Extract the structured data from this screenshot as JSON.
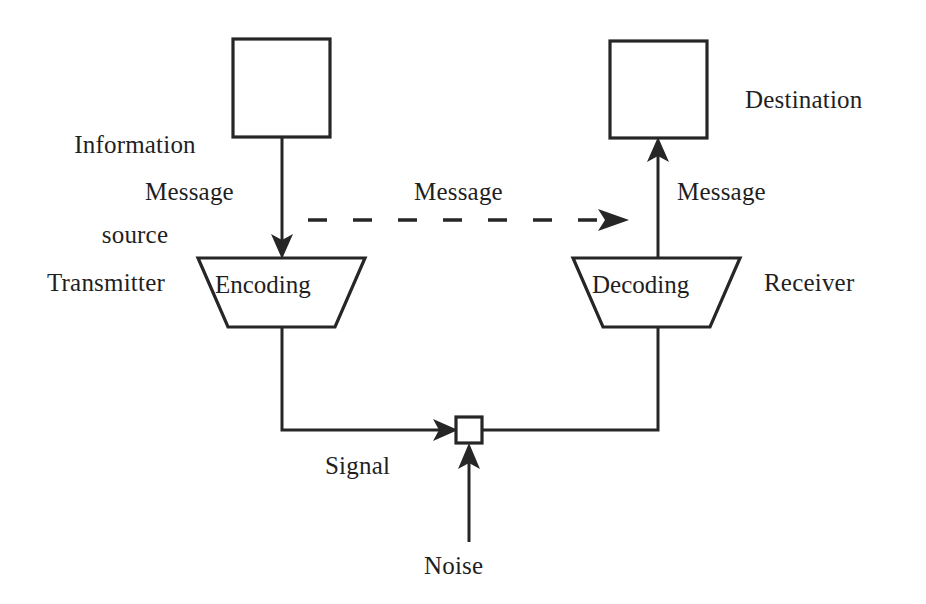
{
  "diagram": {
    "background_color": "#ffffff",
    "stroke_color": "#262626",
    "nodes": {
      "information_source": {
        "label": "Information\nsource",
        "label_line_1": "Information",
        "label_line_2": "source",
        "shape": "rectangle"
      },
      "destination": {
        "label": "Destination",
        "shape": "rectangle"
      },
      "transmitter": {
        "label": "Transmitter",
        "inner_label": "Encoding",
        "shape": "trapezoid"
      },
      "receiver": {
        "label": "Receiver",
        "inner_label": "Decoding",
        "shape": "trapezoid"
      },
      "junction": {
        "label": "",
        "shape": "small-square"
      },
      "noise": {
        "label": "Noise",
        "shape": "none"
      }
    },
    "edges": {
      "source_to_transmitter": {
        "label": "Message",
        "style": "solid",
        "direction": "down"
      },
      "source_to_destination": {
        "label": "Message",
        "style": "dashed",
        "direction": "right"
      },
      "receiver_to_destination": {
        "label": "Message",
        "style": "solid",
        "direction": "up"
      },
      "transmitter_to_receiver": {
        "label": "Signal",
        "style": "solid",
        "direction": "right"
      },
      "noise_to_signal": {
        "label": "",
        "style": "solid",
        "direction": "up"
      }
    }
  }
}
